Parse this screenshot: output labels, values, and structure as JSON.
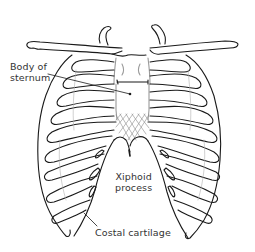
{
  "figure": {
    "colors": {
      "line": "#1a1a1a",
      "faint_line": "#9a9a9a",
      "label_text": "#333333",
      "background": "#ffffff"
    }
  },
  "labels": {
    "body_of_sternum": {
      "line1": "Body of",
      "line2": "sternum"
    },
    "xiphoid_process": {
      "line1": "Xiphoid",
      "line2": "process"
    },
    "costal_cartilage": {
      "text": "Costal cartilage"
    }
  }
}
